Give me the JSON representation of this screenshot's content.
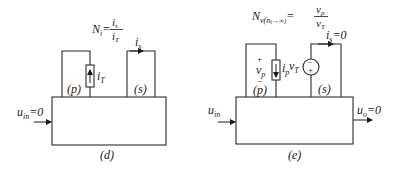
{
  "figures": [
    {
      "id": "d",
      "caption": "(d)",
      "ports": {
        "primary_label": "(p)",
        "secondary_label": "(s)"
      },
      "equation": {
        "lhs": "N",
        "lhs_sub": "i",
        "eq": "=",
        "num": "i",
        "num_sub": "s",
        "den": "i",
        "den_sub": "T"
      },
      "source": {
        "type": "current-source",
        "label": "i",
        "label_sub": "T",
        "direction": "up"
      },
      "secondary_current": {
        "label": "i",
        "label_sub": "s"
      },
      "input": {
        "label": "u",
        "label_sub": "in",
        "value_text": "=0"
      }
    },
    {
      "id": "e",
      "caption": "(e)",
      "ports": {
        "primary_label": "(p)",
        "secondary_label": "(s)"
      },
      "equation": {
        "lhs": "N",
        "lhs_sub": "v(n",
        "lhs_sub2": "i",
        "lhs_sub3": "→∞)",
        "eq": "=",
        "num": "v",
        "num_sub": "p",
        "den": "v",
        "den_sub": "T"
      },
      "primary_voltage": {
        "plus": "+",
        "label": "v",
        "label_sub": "p",
        "minus": "−"
      },
      "primary_current": {
        "label": "i",
        "label_sub": "p",
        "direction": "down"
      },
      "source": {
        "type": "voltage-source",
        "label": "v",
        "label_sub": "T",
        "top_sign": "−",
        "bottom_sign": "+"
      },
      "secondary_current": {
        "label": "i",
        "label_sub": "s",
        "value_text": "=0"
      },
      "input": {
        "label": "u",
        "label_sub": "in"
      },
      "output": {
        "label": "u",
        "label_sub": "o",
        "value_text": "=0"
      }
    }
  ]
}
